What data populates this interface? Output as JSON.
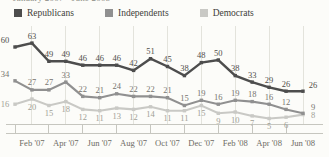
{
  "title": "January 2007 - June 2008",
  "chart_data": {
    "type": "line",
    "title": "January 2007 - June 2008",
    "n_points": 18,
    "x_labels": [
      "Feb '07",
      "Apr '07",
      "Jun '07",
      "Aug '07",
      "Oct '07",
      "Dec '07",
      "Feb '08",
      "Apr '08",
      "Jun '08"
    ],
    "x_label_indices": [
      1,
      3,
      5,
      7,
      9,
      11,
      13,
      15,
      17
    ],
    "ylim": [
      0,
      70
    ],
    "grid": "vertical-only",
    "legend_position": "top",
    "colors": {
      "background": "#fcfcf9",
      "grid": "#e3e3dc",
      "axis": "#c6c6bf",
      "axis_text": "#6d6b64"
    },
    "series": [
      {
        "name": "Republicans",
        "color": "#4d4d4d",
        "label_color": "#504e49",
        "label_side": "above",
        "line_width": 2.4,
        "values": [
          60,
          63,
          49,
          49,
          46,
          46,
          46,
          42,
          51,
          45,
          38,
          48,
          50,
          38,
          33,
          29,
          26,
          26
        ]
      },
      {
        "name": "Independents",
        "color": "#909090",
        "label_color": "#77756f",
        "label_side": "above",
        "line_width": 2.1,
        "values": [
          34,
          27,
          27,
          33,
          22,
          21,
          24,
          22,
          22,
          21,
          15,
          19,
          16,
          19,
          18,
          16,
          12,
          9
        ]
      },
      {
        "name": "Democrats",
        "color": "#c9c9c5",
        "label_color": "#a19f96",
        "label_side": "below",
        "line_width": 2.1,
        "values": [
          16,
          20,
          15,
          18,
          12,
          11,
          13,
          12,
          14,
          11,
          11,
          15,
          9,
          10,
          7,
          5,
          6,
          8
        ]
      }
    ]
  }
}
